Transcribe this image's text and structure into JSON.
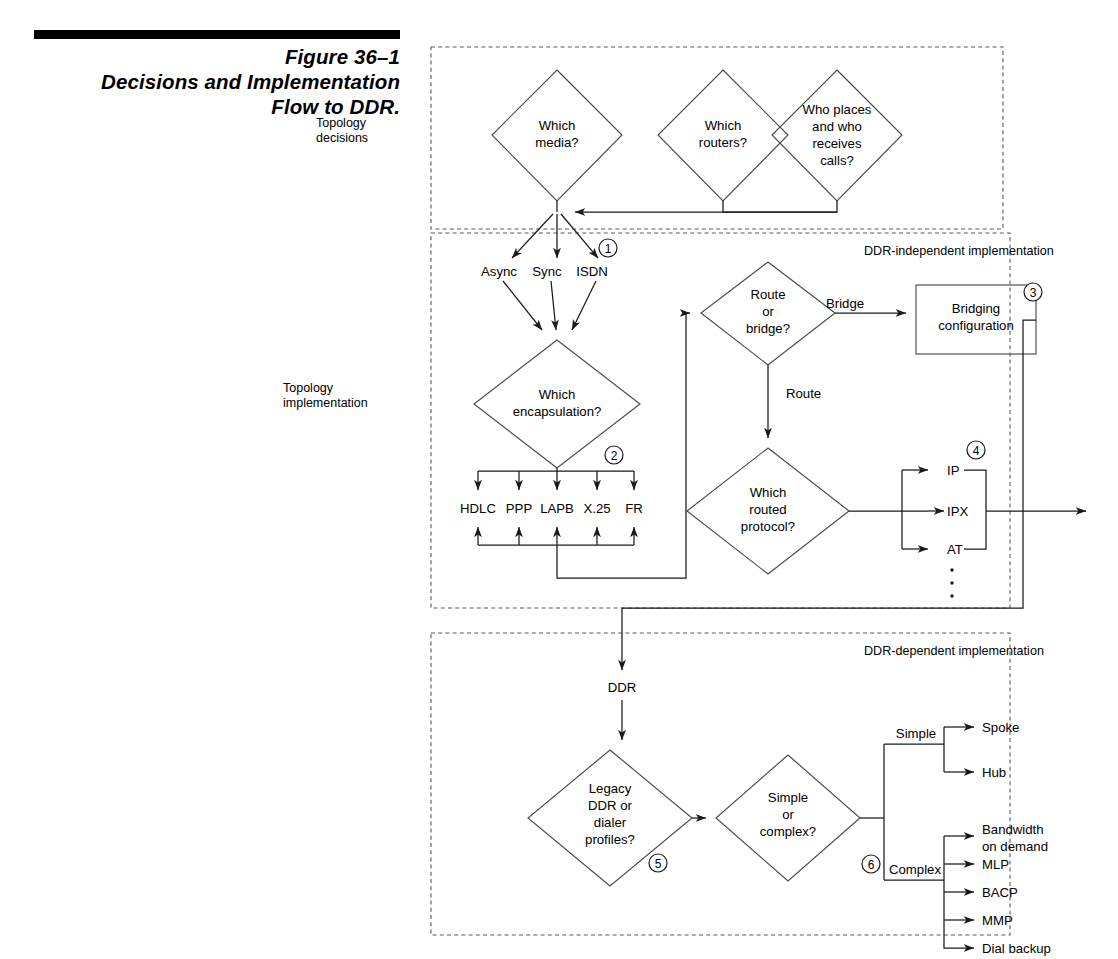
{
  "figure": {
    "number_label": "Figure 36–1",
    "caption_line1": "Decisions and Implementation",
    "caption_line2": "Flow to DDR."
  },
  "section_labels": {
    "topology_decisions_line1": "Topology",
    "topology_decisions_line2": "decisions",
    "topology_implementation_line1": "Topology",
    "topology_implementation_line2": "implementation",
    "ddr_independent": "DDR-independent implementation",
    "ddr_dependent": "DDR-dependent implementation"
  },
  "decisions": {
    "which_media_l1": "Which",
    "which_media_l2": "media?",
    "which_routers_l1": "Which",
    "which_routers_l2": "routers?",
    "who_places_l1": "Who places",
    "who_places_l2": "and who",
    "who_places_l3": "receives",
    "who_places_l4": "calls?",
    "which_encapsulation_l1": "Which",
    "which_encapsulation_l2": "encapsulation?",
    "route_or_bridge_l1": "Route",
    "route_or_bridge_l2": "or",
    "route_or_bridge_l3": "bridge?",
    "which_routed_protocol_l1": "Which",
    "which_routed_protocol_l2": "routed",
    "which_routed_protocol_l3": "protocol?",
    "legacy_ddr_l1": "Legacy",
    "legacy_ddr_l2": "DDR or",
    "legacy_ddr_l3": "dialer",
    "legacy_ddr_l4": "profiles?",
    "simple_or_complex_l1": "Simple",
    "simple_or_complex_l2": "or",
    "simple_or_complex_l3": "complex?"
  },
  "process_boxes": {
    "bridging_configuration_l1": "Bridging",
    "bridging_configuration_l2": "configuration"
  },
  "media_types": [
    "Async",
    "Sync",
    "ISDN"
  ],
  "encapsulations": [
    "HDLC",
    "PPP",
    "LAPB",
    "X.25",
    "FR"
  ],
  "routed_protocols": [
    "IP",
    "IPX",
    "AT"
  ],
  "edge_labels": {
    "bridge": "Bridge",
    "route": "Route",
    "ddr": "DDR",
    "simple": "Simple",
    "complex": "Complex"
  },
  "simple_outputs": [
    "Spoke",
    "Hub"
  ],
  "complex_outputs": [
    "Bandwidth\non demand",
    "MLP",
    "BACP",
    "MMP",
    "Dial backup"
  ],
  "complex_output_labels": {
    "bandwidth_l1": "Bandwidth",
    "bandwidth_l2": "on demand",
    "mlp": "MLP",
    "bacp": "BACP",
    "mmp": "MMP",
    "dial_backup": "Dial backup"
  },
  "step_markers": [
    "1",
    "2",
    "3",
    "4",
    "5",
    "6"
  ],
  "colors": {
    "ink": "#1a1a1a",
    "line": "#3d3d3d",
    "background": "#ffffff"
  }
}
